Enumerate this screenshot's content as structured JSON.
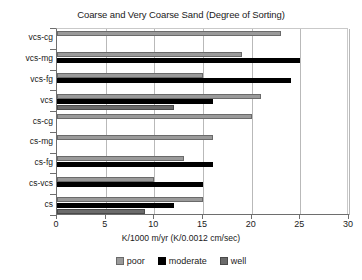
{
  "chart_data": {
    "type": "bar",
    "orientation": "horizontal",
    "title": "Coarse and Very Coarse Sand (Degree of Sorting)",
    "xlabel": "K/1000 m/yr (K/0.0012 cm/sec)",
    "ylabel": "",
    "xlim": [
      0,
      30
    ],
    "xticks": [
      0,
      5,
      10,
      15,
      20,
      25,
      30
    ],
    "xtick_labels": [
      "0",
      "5",
      "10",
      "15",
      "20",
      "25",
      "30"
    ],
    "grid": true,
    "grid_axis": "x",
    "legend_position": "bottom",
    "categories": [
      "vcs-cg",
      "vcs-mg",
      "vcs-fg",
      "vcs",
      "cs-cg",
      "cs-mg",
      "cs-fg",
      "cs-vcs",
      "cs"
    ],
    "series": [
      {
        "name": "poor",
        "color": "#9a9a9a",
        "values": [
          23,
          19,
          15,
          21,
          20,
          16,
          13,
          10,
          15
        ]
      },
      {
        "name": "moderate",
        "color": "#000000",
        "values": [
          0,
          25,
          24,
          16,
          0,
          0,
          16,
          15,
          12
        ]
      },
      {
        "name": "well",
        "color": "#6b6b6b",
        "values": [
          0,
          0,
          0,
          12,
          0,
          0,
          0,
          0,
          9
        ]
      }
    ],
    "legend": [
      {
        "label": "poor",
        "color": "#9a9a9a",
        "swatch": "poor"
      },
      {
        "label": "moderate",
        "color": "#000000",
        "swatch": "moderate"
      },
      {
        "label": "well",
        "color": "#6b6b6b",
        "swatch": "well"
      }
    ]
  }
}
